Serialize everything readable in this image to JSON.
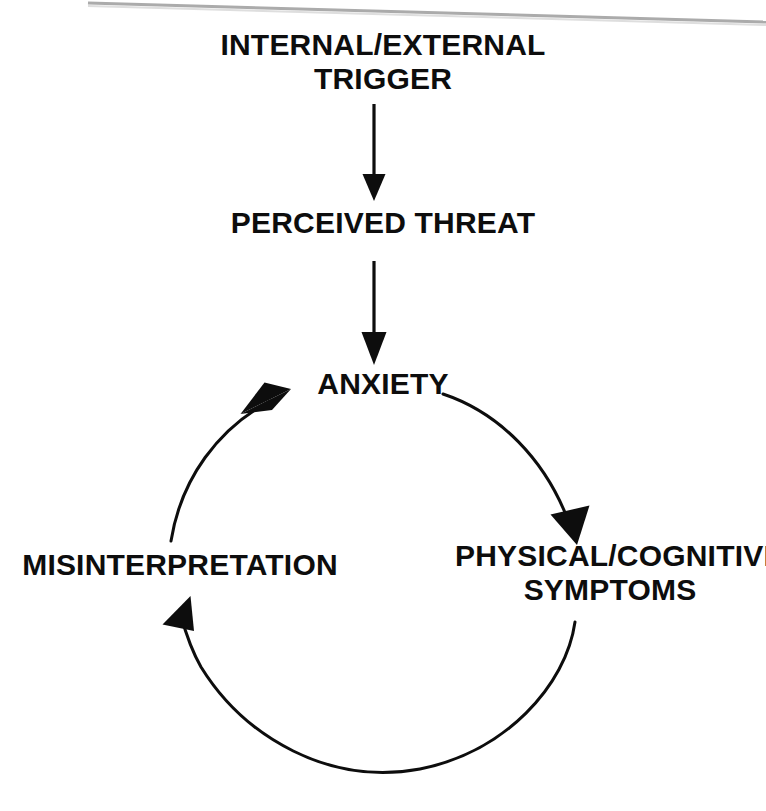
{
  "diagram": {
    "type": "flow-cycle",
    "colors": {
      "ink": "#0d0d0d",
      "background": "#ffffff",
      "scan_artifact": "#9a9a9a"
    },
    "nodes": [
      {
        "id": "trigger",
        "label": "INTERNAL/EXTERNAL\nTRIGGER",
        "lines": [
          "INTERNAL/EXTERNAL",
          "TRIGGER"
        ],
        "x": 383,
        "y": 60
      },
      {
        "id": "threat",
        "label": "PERCEIVED THREAT",
        "lines": [
          "PERCEIVED THREAT"
        ],
        "x": 383,
        "y": 222
      },
      {
        "id": "anxiety",
        "label": "ANXIETY",
        "lines": [
          "ANXIETY"
        ],
        "x": 383,
        "y": 383
      },
      {
        "id": "symptoms",
        "label": "PHYSICAL/COGNITIVE\nSYMPTOMS",
        "lines": [
          "PHYSICAL/COGNITIVE",
          "SYMPTOMS"
        ],
        "x": 610,
        "y": 572
      },
      {
        "id": "misinterpretation",
        "label": "MISINTERPRETATION",
        "lines": [
          "MISINTERPRETATION"
        ],
        "x": 180,
        "y": 572
      }
    ],
    "connectors": [
      {
        "id": "trigger-to-threat",
        "kind": "straight-arrow",
        "from": "trigger",
        "to": "threat",
        "direction": "down"
      },
      {
        "id": "threat-to-anxiety",
        "kind": "straight-arrow",
        "from": "threat",
        "to": "anxiety",
        "direction": "down"
      },
      {
        "id": "anxiety-to-symptoms",
        "kind": "curved-arrow",
        "from": "anxiety",
        "to": "symptoms",
        "direction": "clockwise"
      },
      {
        "id": "symptoms-to-misinterpretation",
        "kind": "curved-arrow",
        "from": "symptoms",
        "to": "misinterpretation",
        "direction": "clockwise"
      },
      {
        "id": "misinterpretation-to-anxiety",
        "kind": "curved-arrow",
        "from": "misinterpretation",
        "to": "anxiety",
        "direction": "clockwise"
      }
    ],
    "cycle": {
      "center_x": 383,
      "center_y": 578,
      "radius": 195
    }
  }
}
